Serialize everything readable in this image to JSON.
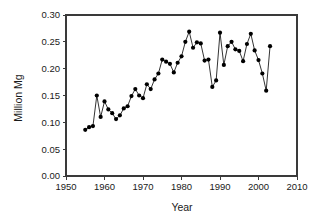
{
  "chart_data": {
    "type": "line",
    "title": "",
    "xlabel": "Year",
    "ylabel": "Million Mg",
    "xlim": [
      1950,
      2010
    ],
    "ylim": [
      0.0,
      0.3
    ],
    "grid": false,
    "legend": null,
    "marker": "filled-circle",
    "x_ticks": [
      1950,
      1960,
      1970,
      1980,
      1990,
      2000,
      2010
    ],
    "x_tick_labels": [
      "1950",
      "1960",
      "1970",
      "1980",
      "1990",
      "2000",
      "2010"
    ],
    "y_ticks": [
      0.0,
      0.05,
      0.1,
      0.15,
      0.2,
      0.25,
      0.3
    ],
    "y_tick_labels": [
      "0.00",
      "0.05",
      "0.10",
      "0.15",
      "0.20",
      "0.25",
      "0.30"
    ],
    "series": [
      {
        "name": "Production",
        "x": [
          1955,
          1956,
          1957,
          1958,
          1959,
          1960,
          1961,
          1962,
          1963,
          1964,
          1965,
          1966,
          1967,
          1968,
          1969,
          1970,
          1971,
          1972,
          1973,
          1974,
          1975,
          1976,
          1977,
          1978,
          1979,
          1980,
          1981,
          1982,
          1983,
          1984,
          1985,
          1986,
          1987,
          1988,
          1989,
          1990,
          1991,
          1992,
          1993,
          1994,
          1995,
          1996,
          1997,
          1998,
          1999,
          2000,
          2001,
          2002,
          2003
        ],
        "values": [
          0.086,
          0.091,
          0.093,
          0.15,
          0.11,
          0.139,
          0.124,
          0.117,
          0.106,
          0.113,
          0.126,
          0.13,
          0.149,
          0.162,
          0.15,
          0.145,
          0.171,
          0.162,
          0.18,
          0.191,
          0.217,
          0.213,
          0.209,
          0.193,
          0.211,
          0.223,
          0.25,
          0.269,
          0.239,
          0.249,
          0.247,
          0.215,
          0.217,
          0.166,
          0.178,
          0.267,
          0.207,
          0.242,
          0.25,
          0.236,
          0.233,
          0.214,
          0.246,
          0.265,
          0.234,
          0.216,
          0.191,
          0.159,
          0.242
        ]
      }
    ]
  },
  "axes": {
    "y_title": "Million Mg",
    "x_title": "Year"
  }
}
